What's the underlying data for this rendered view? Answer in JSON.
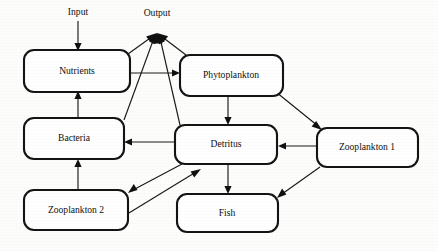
{
  "diagram": {
    "type": "flow-diagram",
    "background_color": "#fdfdfb",
    "line_color": "#1a1a1a",
    "box_stroke_color": "#141414",
    "box_fill_color": "#ffffff",
    "nodes": [
      {
        "id": "nutrients",
        "label": "Nutrients",
        "x": 24,
        "y": 50,
        "w": 106,
        "h": 42
      },
      {
        "id": "phytoplankton",
        "label": "Phytoplankton",
        "x": 180,
        "y": 55,
        "w": 103,
        "h": 41
      },
      {
        "id": "bacteria",
        "label": "Bacteria",
        "x": 24,
        "y": 118,
        "w": 100,
        "h": 41
      },
      {
        "id": "detritus",
        "label": "Detritus",
        "x": 175,
        "y": 125,
        "w": 102,
        "h": 39
      },
      {
        "id": "zooplankton1",
        "label": "Zooplankton 1",
        "x": 317,
        "y": 128,
        "w": 101,
        "h": 39
      },
      {
        "id": "zooplankton2",
        "label": "Zooplankton 2",
        "x": 24,
        "y": 190,
        "w": 104,
        "h": 40
      },
      {
        "id": "fish",
        "label": "Fish",
        "x": 177,
        "y": 194,
        "w": 101,
        "h": 38
      }
    ],
    "io_labels": [
      {
        "id": "input",
        "label": "Input",
        "x": 78,
        "y": 13
      },
      {
        "id": "output",
        "label": "Output",
        "x": 157,
        "y": 14
      }
    ],
    "output_hub": {
      "x": 157,
      "y": 33
    },
    "edges": [
      {
        "id": "input-to-nutrients",
        "from": "input",
        "to": "nutrients",
        "arrow": "to"
      },
      {
        "id": "nutrients-to-phytoplankton",
        "from": "nutrients",
        "to": "phytoplankton",
        "arrow": "to"
      },
      {
        "id": "bacteria-to-nutrients",
        "from": "bacteria",
        "to": "nutrients",
        "arrow": "to"
      },
      {
        "id": "zooplankton2-to-bacteria",
        "from": "zooplankton2",
        "to": "bacteria",
        "arrow": "to"
      },
      {
        "id": "phytoplankton-to-detritus",
        "from": "phytoplankton",
        "to": "detritus",
        "arrow": "to"
      },
      {
        "id": "phytoplankton-to-zooplankton1",
        "from": "phytoplankton",
        "to": "zooplankton1",
        "arrow": "to"
      },
      {
        "id": "detritus-to-bacteria",
        "from": "detritus",
        "to": "bacteria",
        "arrow": "to"
      },
      {
        "id": "zooplankton1-to-detritus",
        "from": "zooplankton1",
        "to": "detritus",
        "arrow": "to"
      },
      {
        "id": "detritus-to-fish",
        "from": "detritus",
        "to": "fish",
        "arrow": "to"
      },
      {
        "id": "zooplankton1-to-fish",
        "from": "zooplankton1",
        "to": "fish",
        "arrow": "to"
      },
      {
        "id": "detritus-to-zooplankton2",
        "from": "detritus",
        "to": "zooplankton2",
        "arrow": "to"
      },
      {
        "id": "zooplankton2-to-detritus",
        "from": "zooplankton2",
        "to": "detritus",
        "arrow": "to"
      },
      {
        "id": "nutrients-to-output",
        "from": "nutrients",
        "to": "output",
        "arrow": "to"
      },
      {
        "id": "phytoplankton-to-output",
        "from": "phytoplankton",
        "to": "output",
        "arrow": "to"
      },
      {
        "id": "bacteria-to-output",
        "from": "bacteria",
        "to": "output",
        "arrow": "to"
      },
      {
        "id": "detritus-to-output",
        "from": "detritus",
        "to": "output",
        "arrow": "to"
      }
    ]
  }
}
